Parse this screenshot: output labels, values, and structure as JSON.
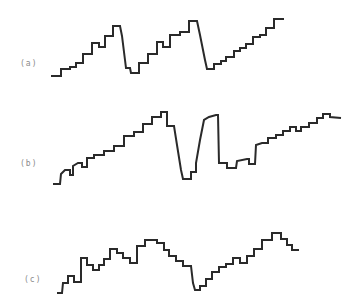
{
  "figure": {
    "panels": [
      {
        "label": "(a)",
        "description": "staircase ramp with two abrupt resets then a final rising staircase",
        "points": [
          [
            52,
            76
          ],
          [
            61,
            76
          ],
          [
            61,
            69
          ],
          [
            70,
            69
          ],
          [
            70,
            67
          ],
          [
            76,
            67
          ],
          [
            76,
            63
          ],
          [
            83,
            63
          ],
          [
            83,
            54
          ],
          [
            92,
            54
          ],
          [
            92,
            43
          ],
          [
            99,
            43
          ],
          [
            99,
            47
          ],
          [
            105,
            47
          ],
          [
            105,
            36
          ],
          [
            113,
            36
          ],
          [
            113,
            26
          ],
          [
            120,
            26
          ],
          [
            122,
            36
          ],
          [
            125,
            60
          ],
          [
            126,
            68
          ],
          [
            130,
            68
          ],
          [
            131,
            73
          ],
          [
            139,
            73
          ],
          [
            139,
            63
          ],
          [
            148,
            63
          ],
          [
            148,
            54
          ],
          [
            157,
            54
          ],
          [
            157,
            42
          ],
          [
            163,
            42
          ],
          [
            163,
            47
          ],
          [
            170,
            47
          ],
          [
            170,
            35
          ],
          [
            180,
            35
          ],
          [
            180,
            32
          ],
          [
            189,
            32
          ],
          [
            189,
            21
          ],
          [
            197,
            21
          ],
          [
            200,
            35
          ],
          [
            205,
            60
          ],
          [
            207,
            69
          ],
          [
            214,
            69
          ],
          [
            214,
            64
          ],
          [
            221,
            64
          ],
          [
            221,
            61
          ],
          [
            226,
            61
          ],
          [
            226,
            57
          ],
          [
            234,
            57
          ],
          [
            234,
            51
          ],
          [
            240,
            51
          ],
          [
            240,
            48
          ],
          [
            246,
            48
          ],
          [
            246,
            44
          ],
          [
            253,
            44
          ],
          [
            253,
            37
          ],
          [
            260,
            37
          ],
          [
            260,
            35
          ],
          [
            266,
            35
          ],
          [
            266,
            28
          ],
          [
            274,
            28
          ],
          [
            274,
            19
          ],
          [
            283,
            19
          ]
        ]
      },
      {
        "label": "(b)",
        "description": "staircase ramp interrupted by a deep notch and recovery, then continuing staircase",
        "points": [
          [
            54,
            184
          ],
          [
            60,
            184
          ],
          [
            61,
            174
          ],
          [
            65,
            170
          ],
          [
            70,
            170
          ],
          [
            70,
            175
          ],
          [
            73,
            175
          ],
          [
            73,
            166
          ],
          [
            78,
            163
          ],
          [
            82,
            163
          ],
          [
            82,
            167
          ],
          [
            87,
            167
          ],
          [
            87,
            158
          ],
          [
            94,
            158
          ],
          [
            94,
            155
          ],
          [
            104,
            155
          ],
          [
            104,
            151
          ],
          [
            114,
            151
          ],
          [
            114,
            146
          ],
          [
            124,
            146
          ],
          [
            124,
            136
          ],
          [
            134,
            136
          ],
          [
            134,
            132
          ],
          [
            143,
            132
          ],
          [
            143,
            124
          ],
          [
            152,
            124
          ],
          [
            152,
            117
          ],
          [
            161,
            117
          ],
          [
            161,
            112
          ],
          [
            167,
            112
          ],
          [
            167,
            126
          ],
          [
            174,
            126
          ],
          [
            177,
            145
          ],
          [
            181,
            170
          ],
          [
            183,
            179
          ],
          [
            191,
            179
          ],
          [
            191,
            172
          ],
          [
            196,
            172
          ],
          [
            196,
            163
          ],
          [
            200,
            140
          ],
          [
            204,
            120
          ],
          [
            209,
            117
          ],
          [
            216,
            115
          ],
          [
            218,
            115
          ],
          [
            219,
            163
          ],
          [
            227,
            163
          ],
          [
            227,
            168
          ],
          [
            236,
            168
          ],
          [
            237,
            161
          ],
          [
            247,
            159
          ],
          [
            249,
            159
          ],
          [
            249,
            164
          ],
          [
            255,
            164
          ],
          [
            256,
            145
          ],
          [
            262,
            143
          ],
          [
            268,
            143
          ],
          [
            268,
            138
          ],
          [
            276,
            138
          ],
          [
            276,
            135
          ],
          [
            283,
            135
          ],
          [
            283,
            131
          ],
          [
            290,
            131
          ],
          [
            290,
            127
          ],
          [
            296,
            127
          ],
          [
            296,
            131
          ],
          [
            301,
            131
          ],
          [
            301,
            127
          ],
          [
            309,
            127
          ],
          [
            309,
            123
          ],
          [
            317,
            123
          ],
          [
            317,
            118
          ],
          [
            323,
            118
          ],
          [
            323,
            114
          ],
          [
            330,
            114
          ],
          [
            330,
            117
          ],
          [
            340,
            118
          ]
        ]
      },
      {
        "label": "(c)",
        "description": "staircase rising to a broad peak, falling to a trough, then rising again and tapering",
        "points": [
          [
            58,
            293
          ],
          [
            62,
            293
          ],
          [
            63,
            283
          ],
          [
            68,
            283
          ],
          [
            68,
            276
          ],
          [
            74,
            276
          ],
          [
            74,
            282
          ],
          [
            81,
            282
          ],
          [
            81,
            258
          ],
          [
            87,
            258
          ],
          [
            87,
            265
          ],
          [
            93,
            265
          ],
          [
            93,
            270
          ],
          [
            99,
            270
          ],
          [
            99,
            265
          ],
          [
            104,
            265
          ],
          [
            104,
            259
          ],
          [
            110,
            259
          ],
          [
            110,
            249
          ],
          [
            117,
            249
          ],
          [
            117,
            253
          ],
          [
            123,
            253
          ],
          [
            123,
            258
          ],
          [
            130,
            258
          ],
          [
            130,
            263
          ],
          [
            137,
            263
          ],
          [
            137,
            246
          ],
          [
            145,
            246
          ],
          [
            145,
            240
          ],
          [
            157,
            240
          ],
          [
            157,
            243
          ],
          [
            164,
            243
          ],
          [
            164,
            250
          ],
          [
            169,
            250
          ],
          [
            169,
            256
          ],
          [
            176,
            256
          ],
          [
            176,
            261
          ],
          [
            183,
            261
          ],
          [
            183,
            266
          ],
          [
            191,
            266
          ],
          [
            193,
            283
          ],
          [
            195,
            290
          ],
          [
            200,
            290
          ],
          [
            200,
            286
          ],
          [
            206,
            286
          ],
          [
            206,
            279
          ],
          [
            212,
            279
          ],
          [
            212,
            272
          ],
          [
            219,
            272
          ],
          [
            219,
            267
          ],
          [
            226,
            267
          ],
          [
            226,
            264
          ],
          [
            233,
            264
          ],
          [
            233,
            258
          ],
          [
            240,
            258
          ],
          [
            240,
            263
          ],
          [
            247,
            263
          ],
          [
            247,
            256
          ],
          [
            254,
            256
          ],
          [
            254,
            249
          ],
          [
            262,
            249
          ],
          [
            262,
            240
          ],
          [
            272,
            240
          ],
          [
            272,
            233
          ],
          [
            281,
            233
          ],
          [
            281,
            239
          ],
          [
            287,
            239
          ],
          [
            287,
            245
          ],
          [
            292,
            245
          ],
          [
            292,
            250
          ],
          [
            298,
            250
          ]
        ]
      }
    ],
    "stroke_color": "#2a2a2a",
    "label_color": "#8a8a8a"
  }
}
